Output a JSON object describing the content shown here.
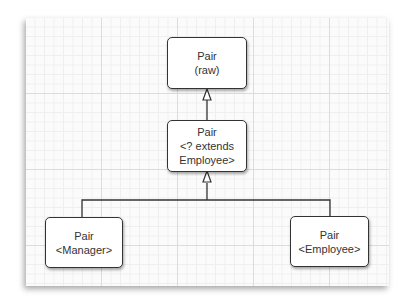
{
  "diagram": {
    "nodes": [
      {
        "id": "pair-raw",
        "lines": [
          "Pair",
          "(raw)"
        ]
      },
      {
        "id": "pair-extends-employee",
        "lines": [
          "Pair",
          "<? extends",
          "Employee>"
        ]
      },
      {
        "id": "pair-manager",
        "lines": [
          "Pair",
          "<Manager>"
        ]
      },
      {
        "id": "pair-employee",
        "lines": [
          "Pair",
          "<Employee>"
        ]
      }
    ],
    "edges": [
      {
        "from": "pair-extends-employee",
        "to": "pair-raw",
        "type": "inheritance"
      },
      {
        "from": "pair-manager",
        "to": "pair-extends-employee",
        "type": "inheritance"
      },
      {
        "from": "pair-employee",
        "to": "pair-extends-employee",
        "type": "inheritance"
      }
    ]
  }
}
